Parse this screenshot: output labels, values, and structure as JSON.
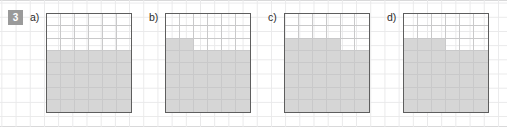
{
  "exercise": {
    "number": "3",
    "badge_color": "#9a9a9a",
    "fill_color": "#d6d6d6",
    "border_color": "#5e5e5e",
    "grid_line_color": "#c9c9ca"
  },
  "grid": {
    "columns": 6,
    "rows": 8
  },
  "panels": [
    {
      "label": "a)",
      "name": "panel-a",
      "filled_column_heights": [
        5,
        5,
        5,
        5,
        5,
        5
      ],
      "filled_cells": 30,
      "total_cells": 48
    },
    {
      "label": "b)",
      "name": "panel-b",
      "filled_column_heights": [
        6,
        6,
        5,
        5,
        5,
        5
      ],
      "filled_cells": 32,
      "total_cells": 48
    },
    {
      "label": "c)",
      "name": "panel-c",
      "filled_column_heights": [
        6,
        6,
        6,
        6,
        5,
        5
      ],
      "filled_cells": 34,
      "total_cells": 48
    },
    {
      "label": "d)",
      "name": "panel-d",
      "filled_column_heights": [
        6,
        6,
        6,
        5,
        5,
        5
      ],
      "filled_cells": 33,
      "total_cells": 48
    }
  ],
  "chart_data": {
    "type": "bar",
    "title": "",
    "xlabel": "",
    "ylabel": "",
    "categories": [
      "1",
      "2",
      "3",
      "4",
      "5",
      "6"
    ],
    "ylim": [
      0,
      8
    ],
    "grid": true,
    "legend": "none",
    "series": [
      {
        "name": "a)",
        "values": [
          5,
          5,
          5,
          5,
          5,
          5
        ]
      },
      {
        "name": "b)",
        "values": [
          6,
          6,
          5,
          5,
          5,
          5
        ]
      },
      {
        "name": "c)",
        "values": [
          6,
          6,
          6,
          6,
          5,
          5
        ]
      },
      {
        "name": "d)",
        "values": [
          6,
          6,
          6,
          5,
          5,
          5
        ]
      }
    ]
  }
}
